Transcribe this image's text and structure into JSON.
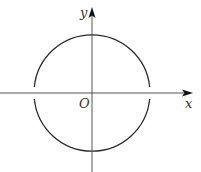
{
  "diagram": {
    "type": "coordinate-plane-circle",
    "axes": {
      "x_label": "x",
      "y_label": "y",
      "origin_label": "O"
    },
    "circle": {
      "center": "O",
      "gaps_at_x_axis": true,
      "description": "Circle centered at origin with small open gaps where it meets the x-axis"
    }
  }
}
